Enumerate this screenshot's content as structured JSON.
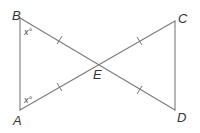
{
  "diagram": {
    "type": "geometry",
    "points": {
      "A": {
        "label": "A",
        "x": 20,
        "y": 110
      },
      "B": {
        "label": "B",
        "x": 20,
        "y": 18
      },
      "C": {
        "label": "C",
        "x": 175,
        "y": 21
      },
      "D": {
        "label": "D",
        "x": 175,
        "y": 110
      },
      "E": {
        "label": "E",
        "x": 100,
        "y": 64
      }
    },
    "segments": [
      "AB",
      "BD",
      "AC",
      "CD"
    ],
    "congruent_marks": [
      "BE",
      "AE",
      "EC",
      "ED"
    ],
    "angles": {
      "angle_B": {
        "vertex": "B",
        "label": "x°"
      },
      "angle_A": {
        "vertex": "A",
        "label": "x°"
      }
    },
    "colors": {
      "line": "#7a7a7a",
      "text": "#333333"
    }
  }
}
